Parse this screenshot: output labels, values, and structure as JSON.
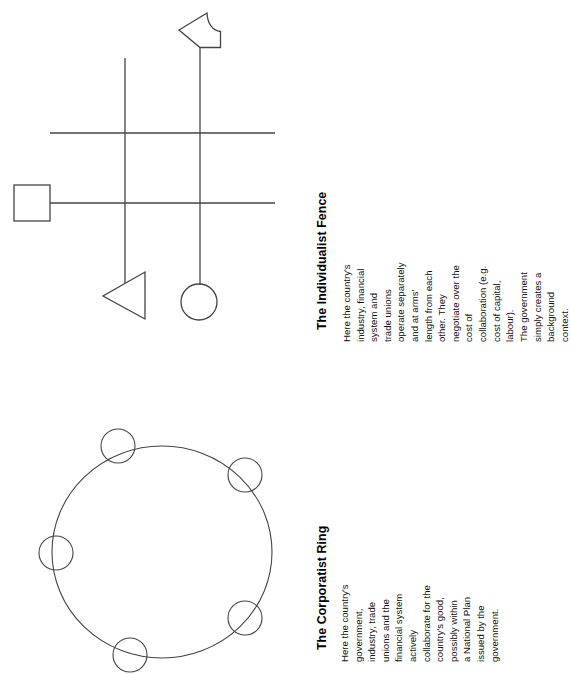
{
  "document": {
    "background_color": "#ffffff",
    "ink_color": "#333333",
    "orientation": "text-rotated-90-ccw"
  },
  "panels": [
    {
      "id": "corporatist-ring",
      "title": "The Corporatist Ring",
      "body": "Here the country's government, industry, trade\nunions and the financial system actively\ncollaborate for the country's good, possibly within\na National Plan issued by the government.",
      "diagram": {
        "type": "ring",
        "description": "A large ring with five small circles spaced around its circumference",
        "node_count": 5,
        "nodes": [
          {
            "label": "node-top-left",
            "cx": 118,
            "cy": 446,
            "r": 17
          },
          {
            "label": "node-top-right",
            "cx": 245,
            "cy": 475,
            "r": 17
          },
          {
            "label": "node-left",
            "cx": 56,
            "cy": 553,
            "r": 17
          },
          {
            "label": "node-bottom-right",
            "cx": 245,
            "cy": 618,
            "r": 17
          },
          {
            "label": "node-bottom",
            "cx": 130,
            "cy": 655,
            "r": 17
          }
        ],
        "ring": {
          "cx": 162,
          "cy": 552,
          "rx": 110,
          "ry": 106
        }
      }
    },
    {
      "id": "individualist-fence",
      "title": "The Individualist Fence",
      "body": "Here the country's industry, financial system and\ntrade unions operate separately and at arms'\nlength from each other.  They negotiate over the\ncost of collaboration (e.g. cost of capital, labour).\nThe government simply creates a background\ncontext.",
      "diagram": {
        "type": "fence",
        "description": "Two horizontal rails crossed by two vertical posts, with four actor shapes attached",
        "rails": [
          {
            "label": "rail-upper",
            "y": 133,
            "x1": 50,
            "x2": 275
          },
          {
            "label": "rail-lower",
            "y": 203,
            "x1": 50,
            "x2": 275
          }
        ],
        "posts": [
          {
            "label": "post-left",
            "x": 125,
            "y1": 58,
            "y2": 283
          },
          {
            "label": "post-right",
            "x": 200,
            "y1": 47,
            "y2": 285
          }
        ],
        "shapes": [
          {
            "label": "square-government",
            "shape": "square",
            "x": 14,
            "y": 185,
            "size": 36
          },
          {
            "label": "flag-industry",
            "shape": "flag",
            "x": 178,
            "y": 13,
            "w": 42,
            "h": 36
          },
          {
            "label": "triangle-trade-unions",
            "shape": "triangle",
            "x": 103,
            "y": 272,
            "w": 42,
            "h": 47
          },
          {
            "label": "circle-financial-system",
            "shape": "circle",
            "cx": 199,
            "cy": 302,
            "r": 18
          }
        ]
      }
    }
  ]
}
